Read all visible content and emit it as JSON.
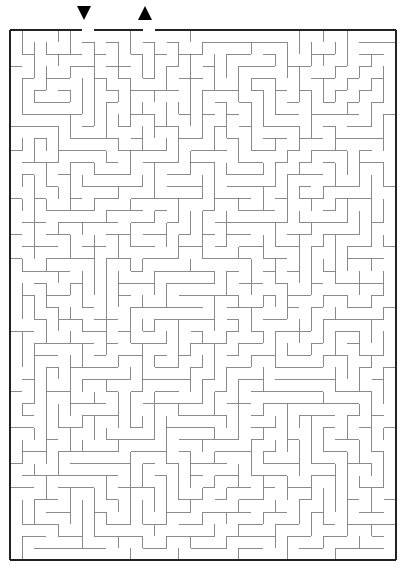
{
  "figure": {
    "type": "maze-puzzle",
    "title": "",
    "background_color": "#ffffff"
  },
  "maze": {
    "columns": 32,
    "rows": 44,
    "cell_size": 12.05,
    "origin_x": 10,
    "origin_y": 30,
    "wall_color": "#8a8a8a",
    "wall_width": 1,
    "border_color": "#222222",
    "border_width": 2,
    "entrance": {
      "label": "entrance",
      "edge": "top",
      "column": 6,
      "marker": "down-triangle",
      "marker_color": "#000000",
      "marker_x": 84,
      "marker_y": 10
    },
    "exit": {
      "label": "exit",
      "edge": "top",
      "column": 11,
      "marker": "up-triangle",
      "marker_color": "#000000",
      "marker_x": 145,
      "marker_y": 10
    },
    "seed": 20240517,
    "algorithm": "depth-first-backtracker"
  },
  "chart_data": {
    "type": "maze",
    "title": "",
    "grid": {
      "cols": 32,
      "rows": 44
    },
    "openings": [
      {
        "name": "entrance",
        "side": "top",
        "col": 6
      },
      {
        "name": "exit",
        "side": "top",
        "col": 11
      }
    ]
  }
}
